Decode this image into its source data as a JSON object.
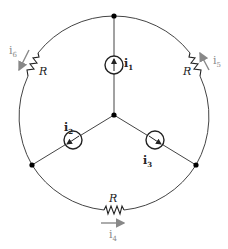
{
  "diagram": {
    "type": "circuit",
    "colors": {
      "wire": "#444444",
      "arrow": "#888888",
      "node": "#000000"
    },
    "sources": [
      {
        "id": "i1",
        "label": "i",
        "sub": "1",
        "direction": "up"
      },
      {
        "id": "i2",
        "label": "i",
        "sub": "2",
        "direction": "down-left"
      },
      {
        "id": "i3",
        "label": "i",
        "sub": "3",
        "direction": "down-right"
      }
    ],
    "resistors": [
      {
        "id": "R_left",
        "label": "R",
        "current": {
          "label": "i",
          "sub": "6"
        }
      },
      {
        "id": "R_right",
        "label": "R",
        "current": {
          "label": "i",
          "sub": "5"
        }
      },
      {
        "id": "R_bottom",
        "label": "R",
        "current": {
          "label": "i",
          "sub": "4"
        }
      }
    ]
  }
}
